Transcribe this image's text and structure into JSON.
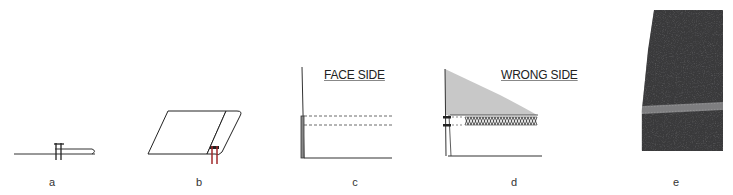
{
  "figure": {
    "panels": [
      {
        "id": "a",
        "caption": "a",
        "description": "cross-section of folded fabric edge with double stitch line"
      },
      {
        "id": "b",
        "caption": "b",
        "description": "fabric piece with edge rolled over, red double needle stitches"
      },
      {
        "id": "c",
        "caption": "c",
        "label": "FACE SIDE",
        "description": "face side view showing two parallel dashed stitch lines"
      },
      {
        "id": "d",
        "caption": "d",
        "label": "WRONG SIDE",
        "description": "wrong side view showing coverstitch zigzag looper thread"
      },
      {
        "id": "e",
        "caption": "e",
        "description": "photograph of dark grey knit fabric hem with coverstitch"
      }
    ],
    "colors": {
      "line": "#222222",
      "stitch_red": "#a0282a",
      "wrong_side_fill": "#c8c8c8",
      "fabric_photo": "#3a3a3c",
      "stitch_photo": "#8a8a8a"
    }
  }
}
